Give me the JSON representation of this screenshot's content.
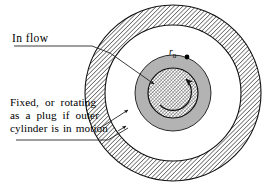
{
  "figure": {
    "background_color": "#ffffff",
    "width": 269,
    "height": 187
  },
  "labels": {
    "in_flow": "In flow",
    "fixed_line1": "Fixed,  or  rotating",
    "fixed_line2": "as  a  plug  if  outer",
    "fixed_line3": "cylinder is in motion",
    "radius_symbol": "r",
    "radius_subscript": "0"
  },
  "geometry": {
    "center_x": 173,
    "center_y": 93,
    "outer_wall_outer_radius": 88,
    "outer_wall_inner_radius": 68,
    "annulus_gray_outer_radius": 38,
    "core_hatched_radius": 25,
    "marker_x": 187,
    "marker_y": 57,
    "marker_radius": 2.4
  },
  "colors": {
    "stroke": "#1a1a1a",
    "hatch": "#2b2b2b",
    "gray_fill": "#b3b3b3",
    "core_fill": "#cfcfcf",
    "background": "#ffffff",
    "text": "#000000"
  },
  "annotations": {
    "inflow_leader": "leader line from 'In flow' label to gray annulus",
    "fixed_leader": "leader line from 'Fixed, or rotating...' label to outer cylinder wall",
    "fixed_arrow": "arrow from label to inner white annulus region",
    "rotation_arrow": "curved arrow inside core indicating rotation"
  }
}
